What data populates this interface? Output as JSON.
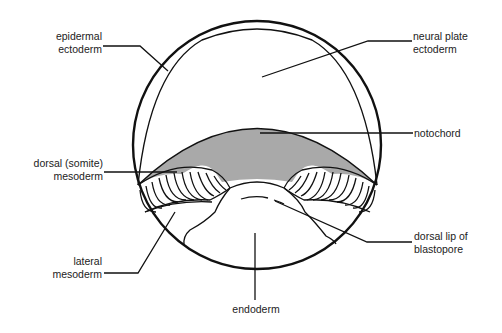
{
  "diagram": {
    "type": "amphibian gastrula cross-section",
    "colors": {
      "outline": "#111111",
      "notochord_fill": "#a9a9a9",
      "background": "#ffffff",
      "text": "#222222"
    },
    "labels": {
      "epidermal_ectoderm": {
        "line1": "epidermal",
        "line2": "ectoderm"
      },
      "neural_plate_ectoderm": {
        "line1": "neural plate",
        "line2": "ectoderm"
      },
      "notochord": {
        "line1": "notochord"
      },
      "dorsal_mesoderm": {
        "line1": "dorsal (somite)",
        "line2": "mesoderm"
      },
      "lateral_mesoderm": {
        "line1": "lateral",
        "line2": "mesoderm"
      },
      "dorsal_lip": {
        "line1": "dorsal lip of",
        "line2": "blastopore"
      },
      "endoderm": {
        "line1": "endoderm"
      }
    }
  }
}
